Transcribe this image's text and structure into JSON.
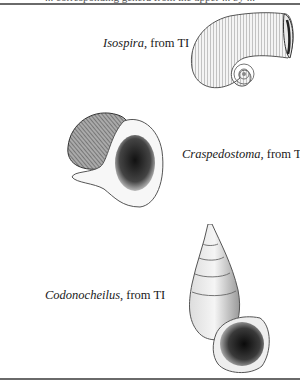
{
  "page": {
    "cut_off_header_text": "... corresponding genera from the upper ... by ..."
  },
  "figures": [
    {
      "genus": "Isospira",
      "suffix": ", from TI",
      "illustration": "coiled-horn-shell-illustration"
    },
    {
      "genus": "Craspedostoma",
      "suffix": ", from TI",
      "illustration": "flared-aperture-snail-illustration"
    },
    {
      "genus": "Codonocheilus",
      "suffix": ", from TI",
      "illustration": "high-spired-bell-mouth-shell-illustration"
    }
  ]
}
